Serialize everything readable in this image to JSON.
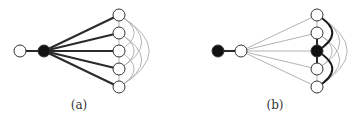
{
  "figures": [
    {
      "id": "a",
      "caption": "(a)",
      "caption_pos": [
        79,
        98
      ],
      "nodes": [
        {
          "id": "leaf",
          "x": 20,
          "y": 51,
          "fill": "white"
        },
        {
          "id": "hub",
          "x": 44,
          "y": 51,
          "fill": "black"
        },
        {
          "id": "r1",
          "x": 119,
          "y": 15,
          "fill": "white"
        },
        {
          "id": "r2",
          "x": 119,
          "y": 33,
          "fill": "white"
        },
        {
          "id": "r3",
          "x": 119,
          "y": 51,
          "fill": "white"
        },
        {
          "id": "r4",
          "x": 119,
          "y": 69,
          "fill": "white"
        },
        {
          "id": "r5",
          "x": 119,
          "y": 87,
          "fill": "white"
        }
      ],
      "edges_thick": [
        [
          "leaf",
          "hub"
        ],
        [
          "hub",
          "r1"
        ],
        [
          "hub",
          "r2"
        ],
        [
          "hub",
          "r3"
        ],
        [
          "hub",
          "r4"
        ],
        [
          "hub",
          "r5"
        ]
      ],
      "edges_thin": [
        [
          "r1",
          "r2"
        ],
        [
          "r2",
          "r3"
        ],
        [
          "r3",
          "r4"
        ],
        [
          "r4",
          "r5"
        ]
      ],
      "arcs_thin": [
        [
          "r1",
          "r3"
        ],
        [
          "r2",
          "r4"
        ],
        [
          "r3",
          "r5"
        ],
        [
          "r1",
          "r4"
        ],
        [
          "r2",
          "r5"
        ],
        [
          "r1",
          "r5"
        ]
      ],
      "arcs_thick": []
    },
    {
      "id": "b",
      "caption": "(b)",
      "caption_pos": [
        275,
        98
      ],
      "nodes": [
        {
          "id": "leaf",
          "x": 218,
          "y": 51,
          "fill": "black"
        },
        {
          "id": "hub",
          "x": 241,
          "y": 51,
          "fill": "white"
        },
        {
          "id": "r1",
          "x": 317,
          "y": 15,
          "fill": "white"
        },
        {
          "id": "r2",
          "x": 317,
          "y": 33,
          "fill": "white"
        },
        {
          "id": "r3",
          "x": 317,
          "y": 51,
          "fill": "black"
        },
        {
          "id": "r4",
          "x": 317,
          "y": 69,
          "fill": "white"
        },
        {
          "id": "r5",
          "x": 317,
          "y": 87,
          "fill": "white"
        }
      ],
      "edges_thick": [
        [
          "leaf",
          "hub"
        ],
        [
          "r2",
          "r3"
        ],
        [
          "r3",
          "r4"
        ]
      ],
      "edges_thin": [
        [
          "hub",
          "r1"
        ],
        [
          "hub",
          "r2"
        ],
        [
          "hub",
          "r3"
        ],
        [
          "hub",
          "r4"
        ],
        [
          "hub",
          "r5"
        ],
        [
          "r1",
          "r2"
        ],
        [
          "r4",
          "r5"
        ]
      ],
      "arcs_thin": [
        [
          "r2",
          "r4"
        ],
        [
          "r1",
          "r4"
        ],
        [
          "r2",
          "r5"
        ],
        [
          "r1",
          "r5"
        ]
      ],
      "arcs_thick": [
        [
          "r1",
          "r3"
        ],
        [
          "r3",
          "r5"
        ]
      ]
    }
  ]
}
